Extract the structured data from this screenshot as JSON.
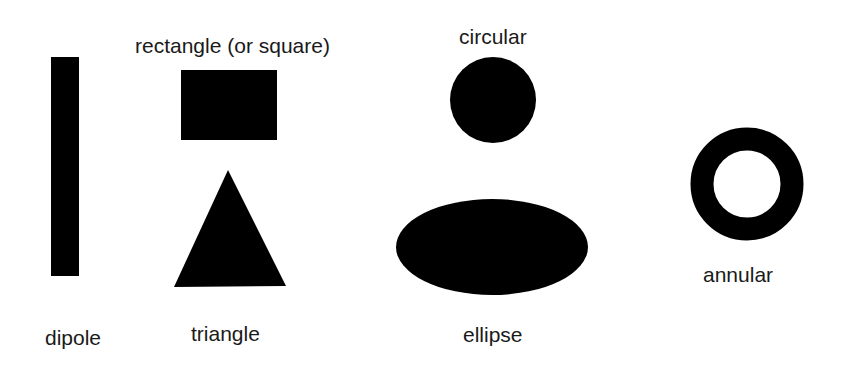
{
  "diagram": {
    "fill_color": "#000000",
    "background": "#ffffff",
    "shapes": [
      {
        "id": "dipole",
        "label": "dipole",
        "kind": "thin-rectangle"
      },
      {
        "id": "rectangle",
        "label": "rectangle (or square)",
        "kind": "rectangle"
      },
      {
        "id": "triangle",
        "label": "triangle",
        "kind": "triangle"
      },
      {
        "id": "circular",
        "label": "circular",
        "kind": "circle"
      },
      {
        "id": "ellipse",
        "label": "ellipse",
        "kind": "ellipse"
      },
      {
        "id": "annular",
        "label": "annular",
        "kind": "ring"
      }
    ]
  }
}
